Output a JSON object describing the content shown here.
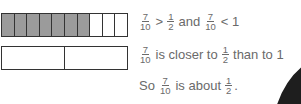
{
  "diagram": {
    "bar_tenths": {
      "total_parts": 10,
      "shaded_parts": 7,
      "shaded_color": "#9b9b9b"
    },
    "bar_halves": {
      "total_parts": 2,
      "shaded_parts": 0
    }
  },
  "statements": {
    "line1": {
      "frac_a": {
        "num": "7",
        "den": "10"
      },
      "op1": ">",
      "frac_b": {
        "num": "1",
        "den": "2"
      },
      "conj": "and",
      "frac_c": {
        "num": "7",
        "den": "10"
      },
      "op2": "< 1"
    },
    "line2": {
      "frac_a": {
        "num": "7",
        "den": "10"
      },
      "text1": "is closer to",
      "frac_b": {
        "num": "1",
        "den": "2"
      },
      "text2": "than to 1"
    },
    "line3": {
      "text0": "So",
      "frac_a": {
        "num": "7",
        "den": "10"
      },
      "text1": "is about",
      "frac_b": {
        "num": "1",
        "den": "2"
      },
      "end": "."
    }
  }
}
